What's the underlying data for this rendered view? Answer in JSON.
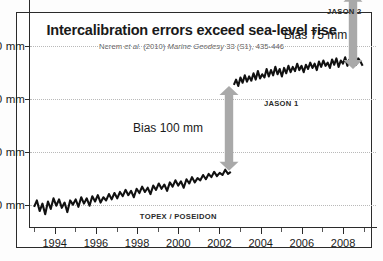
{
  "figure": {
    "title": "Intercalibration errors exceed sea-level rise",
    "subtitle_prefix": "Nerem ",
    "subtitle_italic1": "et al.",
    "subtitle_mid": " (2010) ",
    "subtitle_italic2": "Marine Geodesy",
    "subtitle_suffix": " 33 (S1), 435-446",
    "frame_color": "#2b2b2b",
    "data_color": "#111111",
    "arrow_color": "#a9a9a9"
  },
  "annotations": {
    "bias_100": "Bias 100 mm",
    "bias_75": "Bias 75 mm",
    "topex_label": "TOPEX / POSEIDON",
    "jason1_label": "JASON 1",
    "jason2_label": "JASON 2"
  },
  "chart_data": {
    "type": "line",
    "title": "Intercalibration errors exceed sea-level rise",
    "subtitle": "Nerem et al. (2010) Marine Geodesy 33 (S1), 435-446",
    "xlabel": "",
    "ylabel": "",
    "xlim": [
      1992.8,
      2009.6
    ],
    "ylim": [
      -22,
      178
    ],
    "yticks": [
      0,
      50,
      100,
      150
    ],
    "ytick_labels": [
      "0 mm",
      "50 mm",
      "100 mm",
      "150 mm"
    ],
    "xticks": [
      1994,
      1996,
      1998,
      2000,
      2002,
      2004,
      2006,
      2008
    ],
    "xtick_labels": [
      "1994",
      "1996",
      "1998",
      "2000",
      "2002",
      "2004",
      "2006",
      "2008"
    ],
    "x_minor_ticks": [
      1993,
      1995,
      1997,
      1999,
      2001,
      2003,
      2005,
      2007,
      2009
    ],
    "grid": "horizontal-dotted",
    "legend": "inline-labels",
    "annotations": [
      {
        "text": "Bias 100 mm",
        "x": 2001.2,
        "y": 72,
        "arrow_from_y": 32,
        "arrow_to_y": 112
      },
      {
        "text": "Bias 75 mm",
        "x": 2008.2,
        "y": 160,
        "arrow_from_y": 128,
        "arrow_to_y": 200
      },
      {
        "text": "TOPEX / POSEIDON",
        "x": 2000.0,
        "y": -11
      },
      {
        "text": "JASON 1",
        "x": 2005.0,
        "y": 96
      },
      {
        "text": "JASON 2",
        "x": 2008.9,
        "y": 183
      }
    ],
    "series": [
      {
        "name": "TOPEX / POSEIDON",
        "color": "#111111",
        "x_start": 1993.0,
        "x_end": 2002.55,
        "y_start": 0,
        "y_end": 31,
        "trend_mm_per_year": 3.2,
        "noise_amplitude": 6,
        "values": [
          -2,
          4,
          -6,
          1,
          -9,
          3,
          -4,
          6,
          -1,
          5,
          -3,
          2,
          -7,
          4,
          0,
          5,
          -2,
          7,
          1,
          6,
          -1,
          8,
          3,
          9,
          2,
          7,
          4,
          10,
          5,
          11,
          6,
          12,
          8,
          14,
          9,
          13,
          7,
          15,
          11,
          17,
          12,
          16,
          10,
          18,
          14,
          20,
          15,
          19,
          13,
          21,
          17,
          23,
          18,
          22,
          16,
          24,
          20,
          26,
          21,
          25,
          23,
          28,
          24,
          29,
          26,
          31,
          27,
          30,
          28,
          33,
          29,
          31
        ]
      },
      {
        "name": "JASON 1",
        "color": "#111111",
        "x_start": 2002.7,
        "x_end": 2008.95,
        "y_start": 114,
        "y_end": 131,
        "trend_mm_per_year": 2.9,
        "noise_amplitude": 5,
        "values": [
          113,
          118,
          112,
          120,
          115,
          122,
          116,
          121,
          117,
          124,
          118,
          126,
          119,
          123,
          120,
          128,
          121,
          127,
          122,
          130,
          123,
          128,
          121,
          129,
          124,
          131,
          125,
          130,
          126,
          133,
          127,
          131,
          125,
          132,
          128,
          134,
          129,
          133,
          127,
          135,
          130,
          136,
          131,
          134,
          129,
          137,
          132,
          138,
          130,
          136,
          133,
          139,
          131,
          137,
          134,
          140,
          132,
          138,
          135,
          131
        ]
      },
      {
        "name": "JASON 2",
        "color": "#111111",
        "x_start": 2008.85,
        "x_end": 2009.5,
        "y_start": 196,
        "y_end": 204,
        "noise_amplitude": 7,
        "values": [
          198,
          208,
          194,
          205,
          199,
          210,
          196,
          206,
          200,
          207,
          195,
          203
        ]
      }
    ]
  }
}
